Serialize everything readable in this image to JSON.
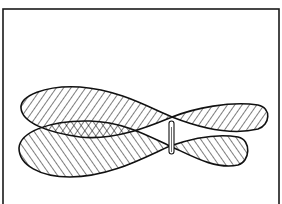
{
  "diagram": {
    "title": "",
    "colors": {
      "ink": "#111111",
      "background": "#ffffff"
    },
    "frame": {
      "x": 3,
      "y": 9,
      "width": 276,
      "height": 200
    },
    "lobes": [
      {
        "name": "upper-lobe-pair",
        "hatch": "diagonal-down",
        "path": "M172,117 C150,108 120,90 80,87 C45,85 20,96 21,108 C22,122 45,132 80,137 C115,141 150,126 172,117 C195,108 230,101 258,105 C272,108 270,125 258,129 C230,136 195,126 172,117 Z"
      },
      {
        "name": "lower-lobe-pair",
        "hatch": "diagonal-up",
        "path": "M170,146 C150,137 125,122 90,121 C50,120 20,132 19,148 C19,165 40,177 70,177 C110,177 145,157 170,146 C190,139 215,133 238,137 C252,140 250,162 238,165 C215,170 190,155 170,146 Z"
      }
    ],
    "antenna": {
      "name": "antenna-rod",
      "x": 169,
      "y": 121,
      "width": 5,
      "height": 33
    }
  }
}
